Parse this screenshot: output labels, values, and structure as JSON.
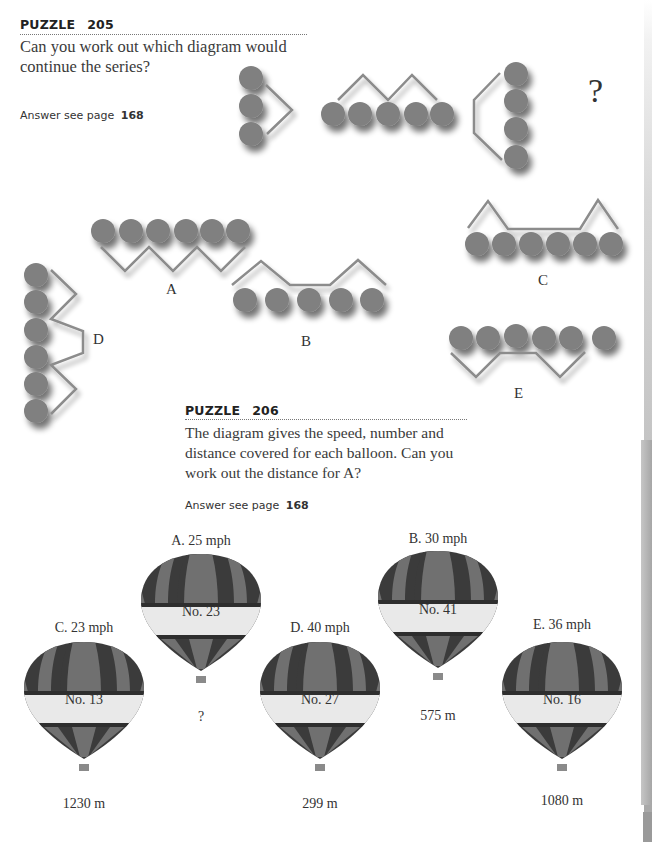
{
  "puzzle205": {
    "title_word": "PUZZLE",
    "number": "205",
    "question": "Can you work out which diagram would continue the series?",
    "question_line1": "Can you work out which diagram would",
    "question_line2": "continue the series?",
    "answer_prefix": "Answer see page",
    "answer_page": "168",
    "series_unknown": "?",
    "series": [
      {
        "circles": 3,
        "orientation": "vertical"
      },
      {
        "circles": 5,
        "orientation": "horizontal"
      },
      {
        "circles": 4,
        "orientation": "vertical"
      }
    ],
    "options": [
      {
        "label": "A",
        "circles": 6
      },
      {
        "label": "B",
        "circles": 5
      },
      {
        "label": "C",
        "circles": 6
      },
      {
        "label": "D",
        "circles": 6
      },
      {
        "label": "E",
        "circles": 6
      }
    ]
  },
  "puzzle206": {
    "title_word": "PUZZLE",
    "number": "206",
    "question_line1": "The diagram gives the speed, number and",
    "question_line2": "distance covered for each balloon. Can you",
    "question_line3": "work out the distance for A?",
    "answer_prefix": "Answer see page",
    "answer_page": "168",
    "balloons": [
      {
        "id": "A",
        "speed": "A. 25 mph",
        "number": "No. 23",
        "distance": "?"
      },
      {
        "id": "B",
        "speed": "B. 30 mph",
        "number": "No. 41",
        "distance": "575 m"
      },
      {
        "id": "C",
        "speed": "C. 23 mph",
        "number": "No. 13",
        "distance": "1230 m"
      },
      {
        "id": "D",
        "speed": "D. 40 mph",
        "number": "No. 27",
        "distance": "299 m"
      },
      {
        "id": "E",
        "speed": "E. 36 mph",
        "number": "No. 16",
        "distance": "1080 m"
      }
    ]
  },
  "colors": {
    "circle": "#808080",
    "line": "#8c8c8c",
    "balloon_dark": "#3b3b3b",
    "balloon_mid": "#707070",
    "balloon_band": "#e9e9e9",
    "basket": "#8a8a8a"
  }
}
